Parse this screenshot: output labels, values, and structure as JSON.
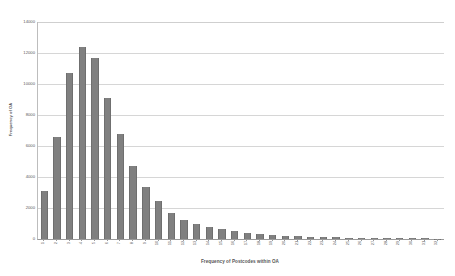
{
  "chart_data": {
    "type": "bar",
    "title": "",
    "xlabel": "Frequency of Postcodes within OA",
    "ylabel": "Frequency of OA",
    "ylim": [
      0,
      14000
    ],
    "ytick_step": 2000,
    "grid": true,
    "legend": "none",
    "bar_color": "#808080",
    "categories": [
      "1",
      "2",
      "3",
      "4",
      "5",
      "6",
      "7",
      "8",
      "9",
      "10",
      "11",
      "12",
      "13",
      "14",
      "15",
      "16",
      "17",
      "18",
      "19",
      "20",
      "21",
      "22",
      "23",
      "24",
      "25",
      "26",
      "27",
      "28",
      "29",
      "30",
      "31",
      "32"
    ],
    "values": [
      3100,
      6600,
      10700,
      12400,
      11700,
      9100,
      6800,
      4700,
      3350,
      2450,
      1700,
      1250,
      1000,
      800,
      640,
      520,
      420,
      330,
      270,
      220,
      180,
      150,
      130,
      110,
      95,
      80,
      70,
      60,
      52,
      45,
      38,
      30
    ],
    "ytick_labels": [
      "0",
      "2000",
      "4000",
      "6000",
      "8000",
      "10000",
      "12000",
      "14000"
    ],
    "ytick_values": [
      0,
      2000,
      4000,
      6000,
      8000,
      10000,
      12000,
      14000
    ]
  }
}
